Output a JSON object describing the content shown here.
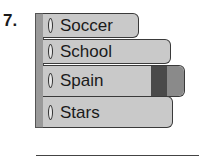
{
  "question": {
    "number": "7."
  },
  "books": [
    {
      "label": "Soccer"
    },
    {
      "label": "School"
    },
    {
      "label": "Spain"
    },
    {
      "label": "Stars"
    }
  ],
  "colors": {
    "book_fill": "#c9c9c9",
    "spine_fill": "#9a9a9a",
    "band_dark": "#4a4a4a",
    "band_mid": "#8a8a8a"
  }
}
